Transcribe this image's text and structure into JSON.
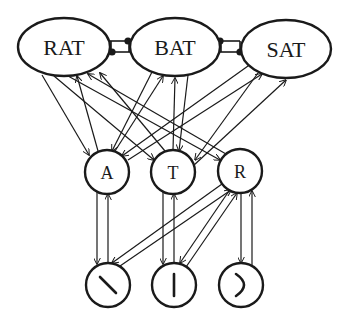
{
  "levels": {
    "words": [
      {
        "id": "RAT",
        "label": "RAT"
      },
      {
        "id": "BAT",
        "label": "BAT"
      },
      {
        "id": "SAT",
        "label": "SAT"
      }
    ],
    "letters": [
      {
        "id": "A",
        "label": "A"
      },
      {
        "id": "T",
        "label": "T"
      },
      {
        "id": "R",
        "label": "R"
      }
    ],
    "features": [
      {
        "id": "f-diag",
        "glyph": "diagonal-stroke"
      },
      {
        "id": "f-vert",
        "glyph": "vertical-stroke"
      },
      {
        "id": "f-curve",
        "glyph": "right-curve"
      }
    ]
  },
  "connections": {
    "inhibitory": [
      {
        "from": "RAT",
        "to": "BAT"
      },
      {
        "from": "BAT",
        "to": "RAT"
      },
      {
        "from": "BAT",
        "to": "SAT"
      },
      {
        "from": "SAT",
        "to": "BAT"
      }
    ],
    "excitatory": [
      {
        "from": "RAT",
        "to": "A"
      },
      {
        "from": "A",
        "to": "RAT"
      },
      {
        "from": "RAT",
        "to": "T"
      },
      {
        "from": "T",
        "to": "RAT"
      },
      {
        "from": "RAT",
        "to": "R"
      },
      {
        "from": "R",
        "to": "RAT"
      },
      {
        "from": "BAT",
        "to": "A"
      },
      {
        "from": "A",
        "to": "BAT"
      },
      {
        "from": "BAT",
        "to": "T"
      },
      {
        "from": "T",
        "to": "BAT"
      },
      {
        "from": "SAT",
        "to": "A"
      },
      {
        "from": "A",
        "to": "SAT"
      },
      {
        "from": "SAT",
        "to": "T"
      },
      {
        "from": "T",
        "to": "SAT"
      },
      {
        "from": "A",
        "to": "f-diag"
      },
      {
        "from": "f-diag",
        "to": "A"
      },
      {
        "from": "T",
        "to": "f-vert"
      },
      {
        "from": "f-vert",
        "to": "T"
      },
      {
        "from": "R",
        "to": "f-diag"
      },
      {
        "from": "f-diag",
        "to": "R"
      },
      {
        "from": "R",
        "to": "f-vert"
      },
      {
        "from": "f-vert",
        "to": "R"
      },
      {
        "from": "R",
        "to": "f-curve"
      },
      {
        "from": "f-curve",
        "to": "R"
      }
    ]
  }
}
